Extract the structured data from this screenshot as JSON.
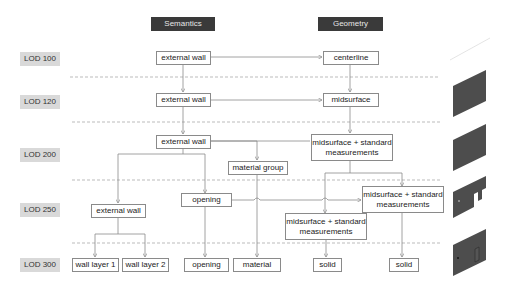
{
  "headers": {
    "semantics": "Semantics",
    "geometry": "Geometry"
  },
  "lod_levels": [
    "LOD 100",
    "LOD 120",
    "LOD 200",
    "LOD 250",
    "LOD 300"
  ],
  "semantics_nodes": {
    "lod100_external_wall": "external wall",
    "lod120_external_wall": "external wall",
    "lod200_external_wall": "external wall",
    "lod200_material_group": "material group",
    "lod250_external_wall": "external wall",
    "lod250_opening": "opening",
    "lod300_wall_layer_1": "wall layer 1",
    "lod300_wall_layer_2": "wall layer 2",
    "lod300_opening": "opening",
    "lod300_material": "material"
  },
  "geometry_nodes": {
    "lod100_centerline": "centerline",
    "lod120_midsurface": "midsurface",
    "lod200_midsurface_std": "midsurface + standard\nmeasurements",
    "lod250_midsurface_std_right": "midsurface + standard\nmeasurements",
    "lod250_midsurface_std_left": "midsurface + standard\nmeasurements",
    "lod300_solid_left": "solid",
    "lod300_solid_right": "solid"
  },
  "colors": {
    "header_bg": "#3a3a3a",
    "lod_bg": "#d9d9d9",
    "line": "#8a8a8a",
    "thumb": "#4a4a4a"
  }
}
